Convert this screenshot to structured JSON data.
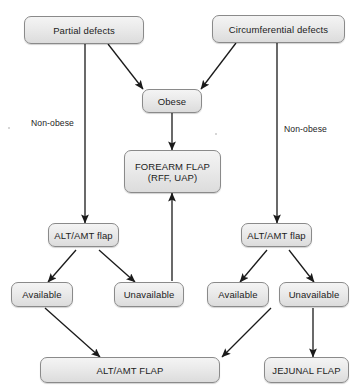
{
  "diagram": {
    "background_color": "#ffffff",
    "node_fill": "#e9e9e9",
    "node_border": "#8a8a8a",
    "edge_color": "#1a1a1a",
    "nodes": [
      {
        "id": "partial_defects",
        "label": "Partial defects"
      },
      {
        "id": "circumferential_defects",
        "label": "Circumferential defects"
      },
      {
        "id": "obese",
        "label": "Obese"
      },
      {
        "id": "forearm_flap_line1",
        "label": "FOREARM FLAP"
      },
      {
        "id": "forearm_flap_line2",
        "label": "(RFF, UAP)"
      },
      {
        "id": "alt_amt_flap_left",
        "label": "ALT/AMT flap"
      },
      {
        "id": "alt_amt_flap_right",
        "label": "ALT/AMT flap"
      },
      {
        "id": "available_left",
        "label": "Available"
      },
      {
        "id": "unavailable_left",
        "label": "Unavailable"
      },
      {
        "id": "available_right",
        "label": "Available"
      },
      {
        "id": "unavailable_right",
        "label": "Unavailable"
      },
      {
        "id": "alt_amt_flap_result",
        "label": "ALT/AMT FLAP"
      },
      {
        "id": "jejunal_flap_result",
        "label": "JEJUNAL FLAP"
      }
    ],
    "edge_labels": [
      {
        "id": "non_obese_left",
        "label": "Non-obese"
      },
      {
        "id": "non_obese_right",
        "label": "Non-obese"
      }
    ]
  }
}
